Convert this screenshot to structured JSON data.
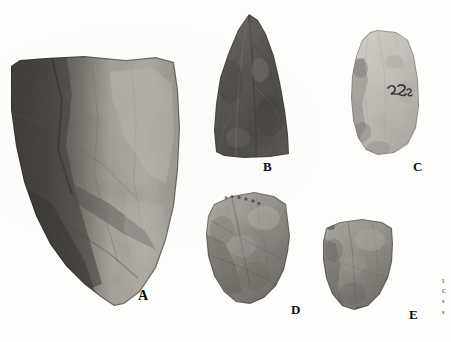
{
  "plate": {
    "kind": "archaeological-artifact-photo-plate",
    "background_color": "#fdfdfc",
    "description": "Black and white photographic plate of five chipped stone artifacts on a plain white background, each labelled with a bold capital letter.",
    "artifact_count": 5
  },
  "artifacts": [
    {
      "id": "a",
      "label": "A",
      "label_x": 138,
      "label_y": 289,
      "label_size": 14,
      "shape": "large broad flake, flat squared top, tapering to a rounded point at lower left",
      "tone": "dark grey left half, lighter grey right half, strong tonal break down the centre",
      "dark_color": "#474543",
      "light_color": "#a9a6a0",
      "surface_markings": "none visible"
    },
    {
      "id": "b",
      "label": "B",
      "label_x": 263,
      "label_y": 160,
      "label_size": 13,
      "shape": "triangular pointed biface, apex at top, broad squared base",
      "tone": "medium to dark grey, evenly mottled",
      "dark_color": "#4e4c49",
      "light_color": "#8d8a85",
      "surface_markings": "none visible"
    },
    {
      "id": "c",
      "label": "C",
      "label_x": 413,
      "label_y": 160,
      "label_size": 13,
      "shape": "ovate flake with irregular left margin and rounded base",
      "tone": "light grey, pale and bright overall with darker patches on the left edge",
      "dark_color": "#8e8c88",
      "light_color": "#cfccc6",
      "surface_markings": "handwritten ink catalogue number",
      "ink_number": "725",
      "ink_x": 392,
      "ink_y": 92
    },
    {
      "id": "d",
      "label": "D",
      "label_x": 291,
      "label_y": 303,
      "label_size": 13,
      "shape": "broad flake, angled upper edge sloping to the right, pointed lower left",
      "tone": "medium grey, mottled, slightly darker at the lower left",
      "dark_color": "#57544f",
      "light_color": "#a5a29c",
      "surface_markings": "faint inked lettering along upper edge"
    },
    {
      "id": "e",
      "label": "E",
      "label_x": 409,
      "label_y": 308,
      "label_size": 13,
      "shape": "small squat flake with straight top edge and rounded lower margin",
      "tone": "medium grey, evenly mottled",
      "dark_color": "#56534e",
      "light_color": "#a09d97",
      "surface_markings": "none visible"
    }
  ],
  "caption": {
    "cut_off": true,
    "lines": [
      "I",
      "C",
      "s",
      "s"
    ]
  }
}
